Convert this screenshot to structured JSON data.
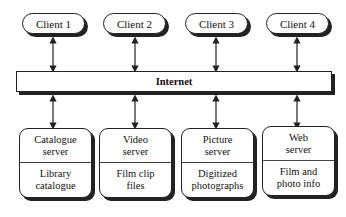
{
  "clients": [
    {
      "label": "Client 1"
    },
    {
      "label": "Client 2"
    },
    {
      "label": "Client 3"
    },
    {
      "label": "Client 4"
    }
  ],
  "network": {
    "label": "Internet"
  },
  "servers": [
    {
      "title_line1": "Catalogue",
      "title_line2": "server",
      "content_line1": "Library",
      "content_line2": "catalogue"
    },
    {
      "title_line1": "Video",
      "title_line2": "server",
      "content_line1": "Film clip",
      "content_line2": "files"
    },
    {
      "title_line1": "Picture",
      "title_line2": "server",
      "content_line1": "Digitized",
      "content_line2": "photographs"
    },
    {
      "title_line1": "Web",
      "title_line2": "server",
      "content_line1": "Film and",
      "content_line2": "photo info"
    }
  ],
  "colors": {
    "stroke": "#222222",
    "background": "#ffffff"
  }
}
